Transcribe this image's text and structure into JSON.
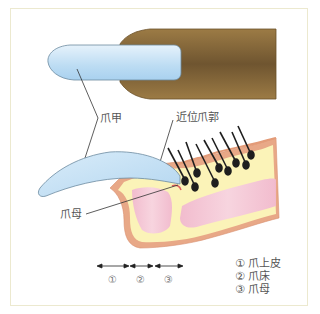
{
  "diagram": {
    "labels": {
      "nail_plate": "爪甲",
      "proximal_nail_fold": "近位爪郭",
      "nail_matrix": "爪母"
    },
    "region_markers": [
      "①",
      "②",
      "③"
    ],
    "legend": [
      {
        "marker": "①",
        "text": "爪上皮"
      },
      {
        "marker": "②",
        "text": "爪床"
      },
      {
        "marker": "③",
        "text": "爪母"
      }
    ],
    "colors": {
      "frame_border": "#ece9cf",
      "nail_blue": "#cfe6f7",
      "finger_brown": "#8a6a3a",
      "skin_yellow": "#fbf3b8",
      "skin_edge": "#e8a887",
      "tissue_pink": "#f3c4d6",
      "hair": "#222222",
      "text": "#555555"
    }
  }
}
